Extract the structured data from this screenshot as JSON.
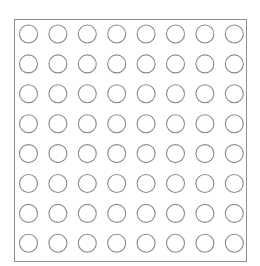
{
  "diagram": {
    "type": "circle-grid",
    "rows": 8,
    "columns": 8,
    "cell_state": "empty",
    "frame": {
      "x": 14,
      "y": 19,
      "width": 232,
      "height": 242
    },
    "circle": {
      "radius": 9,
      "first_center": {
        "x": 28.5,
        "y": 34
      },
      "step_x": 29.4,
      "step_y": 29.9
    },
    "colors": {
      "background": "#ffffff",
      "frame_stroke": "#8e8e8e",
      "circle_stroke": "#8a8a8a",
      "circle_fill": "#ffffff"
    }
  }
}
